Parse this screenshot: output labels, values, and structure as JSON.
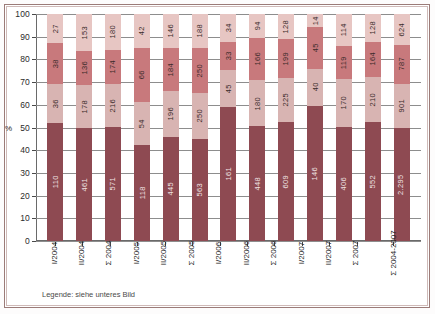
{
  "chart_data": {
    "type": "bar",
    "subtype": "100% stacked column",
    "title": "",
    "xlabel": "",
    "ylabel": "%",
    "ylim": [
      0,
      100
    ],
    "yticks": [
      0,
      10,
      20,
      30,
      40,
      50,
      60,
      70,
      80,
      90,
      100
    ],
    "grid": true,
    "legend_position": "none",
    "legend_note": "Legende: siehe unteres Bild",
    "categories": [
      "I/2004",
      "II/2004",
      "Σ 2004",
      "I/2005",
      "II/2005",
      "Σ 2005",
      "I/2006",
      "II/2006",
      "Σ 2006",
      "I/2007",
      "II/2007",
      "Σ 2007",
      "Σ 2004-2007"
    ],
    "series": [
      {
        "name": "segment-1",
        "color": "#8e4a52",
        "label_color": "light",
        "values": [
          110,
          461,
          571,
          118,
          445,
          563,
          161,
          448,
          609,
          146,
          406,
          552,
          2295
        ],
        "labels": [
          "110",
          "461",
          "571",
          "118",
          "445",
          "563",
          "161",
          "448",
          "609",
          "146",
          "406",
          "552",
          "2.295"
        ]
      },
      {
        "name": "segment-2",
        "color": "#d8b4b2",
        "label_color": "dark",
        "values": [
          36,
          178,
          216,
          54,
          196,
          250,
          45,
          180,
          225,
          40,
          170,
          210,
          901
        ],
        "labels": [
          "36",
          "178",
          "216",
          "54",
          "196",
          "250",
          "45",
          "180",
          "225",
          "40",
          "170",
          "210",
          "901"
        ]
      },
      {
        "name": "segment-3",
        "color": "#c8797c",
        "label_color": "dark",
        "values": [
          38,
          136,
          174,
          66,
          184,
          250,
          33,
          166,
          199,
          45,
          119,
          164,
          787
        ],
        "labels": [
          "38",
          "136",
          "174",
          "66",
          "184",
          "250",
          "33",
          "166",
          "199",
          "45",
          "119",
          "164",
          "787"
        ]
      },
      {
        "name": "segment-4",
        "color": "#e7c6c3",
        "label_color": "dark",
        "values": [
          27,
          153,
          180,
          42,
          146,
          188,
          34,
          94,
          128,
          14,
          114,
          128,
          624
        ],
        "labels": [
          "27",
          "153",
          "180",
          "42",
          "146",
          "188",
          "34",
          "94",
          "128",
          "14",
          "114",
          "128",
          "624"
        ]
      }
    ]
  },
  "colors": {
    "segment_1": "#8e4a52",
    "segment_2": "#d8b4b2",
    "segment_3": "#c8797c",
    "segment_4": "#e7c6c3",
    "frame_outer": "#9b7b78",
    "axis": "#6a6a6a",
    "grid": "#8d8d8d",
    "text": "#1f1f1f"
  },
  "axis": {
    "y_unit": "%",
    "y_ticks": [
      "100",
      "90",
      "80",
      "70",
      "60",
      "50",
      "40",
      "30",
      "20",
      "10",
      "0"
    ]
  },
  "footer": {
    "legend_note": "Legende: siehe unteres Bild"
  }
}
